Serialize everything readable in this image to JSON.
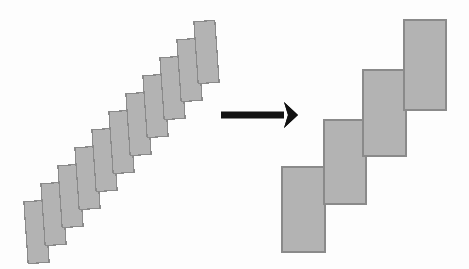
{
  "page": {
    "width": 469,
    "height": 269,
    "background_color": "#fdfdfd"
  },
  "style": {
    "tile_fill": "#b3b3b3",
    "tile_stroke": "#8a8a8a",
    "tile_stroke_width": 1.2,
    "arrow_color": "#111111"
  },
  "diagram": {
    "left_group": {
      "label": "fine-staircase",
      "count": 11,
      "tile_width": 21,
      "tile_height": 62,
      "rotation_deg": -4,
      "start_x": 26,
      "start_y": 201,
      "step_x": 17,
      "step_y": -18
    },
    "arrow": {
      "label": "transform-arrow",
      "direction": "right",
      "shaft_start_x": 221,
      "shaft_end_x": 284,
      "tip_x": 298,
      "center_y": 115,
      "shaft_thickness": 7,
      "head_half_height": 13,
      "head_notch": 4
    },
    "right_group": {
      "label": "coarse-staircase",
      "count": 4,
      "tile_width": 42,
      "tile_height": 85,
      "tiles": [
        {
          "x": 282,
          "y": 167,
          "width": 43,
          "height": 85
        },
        {
          "x": 324,
          "y": 120,
          "width": 42,
          "height": 84
        },
        {
          "x": 363,
          "y": 70,
          "width": 43,
          "height": 86
        },
        {
          "x": 404,
          "y": 20,
          "width": 42,
          "height": 90
        }
      ]
    }
  }
}
